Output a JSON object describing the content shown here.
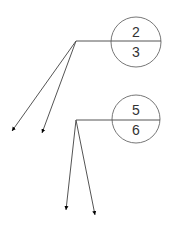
{
  "callouts": [
    {
      "top_value": "2",
      "bottom_value": "3"
    },
    {
      "top_value": "5",
      "bottom_value": "6"
    }
  ],
  "colors": {
    "line": "#555555",
    "arrow": "#000000",
    "text": "#333333",
    "background": "#ffffff"
  }
}
